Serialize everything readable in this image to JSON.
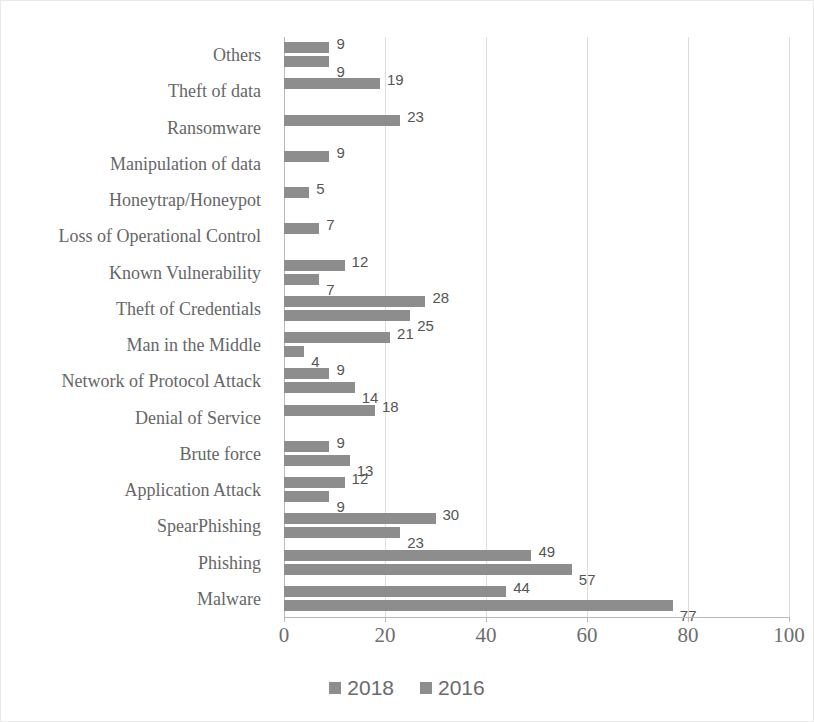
{
  "chart_data": {
    "type": "bar",
    "orientation": "horizontal",
    "title": "",
    "xlabel": "",
    "ylabel": "",
    "xlim": [
      0,
      100
    ],
    "xticks": [
      0,
      20,
      40,
      60,
      80,
      100
    ],
    "grid": true,
    "legend_position": "bottom",
    "bar_color": "#8d8d8d",
    "categories": [
      "Others",
      "Theft of data",
      "Ransomware",
      "Manipulation of data",
      "Honeytrap/Honeypot",
      "Loss of Operational Control",
      "Known Vulnerability",
      "Theft of Credentials",
      "Man in the Middle",
      "Network of Protocol Attack",
      "Denial of Service",
      "Brute force",
      "Application Attack",
      "SpearPhishing",
      "Phishing",
      "Malware"
    ],
    "series": [
      {
        "name": "2018",
        "values": [
          9,
          19,
          23,
          9,
          5,
          7,
          12,
          28,
          21,
          9,
          18,
          9,
          12,
          30,
          49,
          44
        ]
      },
      {
        "name": "2016",
        "values": [
          9,
          null,
          null,
          null,
          null,
          null,
          7,
          25,
          4,
          14,
          null,
          13,
          9,
          23,
          57,
          77
        ]
      }
    ]
  },
  "legend": {
    "items": [
      {
        "label": "2018"
      },
      {
        "label": "2016"
      }
    ]
  },
  "axis": {
    "x_tick_labels": [
      "0",
      "20",
      "40",
      "60",
      "80",
      "100"
    ]
  }
}
